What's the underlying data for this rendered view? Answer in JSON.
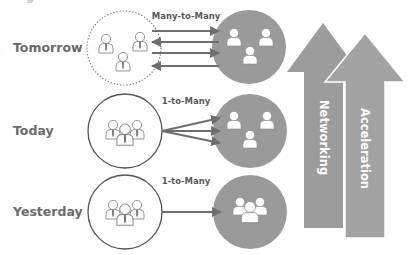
{
  "diagram": {
    "top_fragment": "g",
    "rows": [
      {
        "id": "tomorrow",
        "label": "Tomorrow",
        "link_label": "Many-to-Many",
        "link_type": "many-to-many",
        "source_style": "dotted",
        "arrows": [
          "right",
          "left",
          "right",
          "left"
        ]
      },
      {
        "id": "today",
        "label": "Today",
        "link_label": "1-to-Many",
        "link_type": "fan-out",
        "source_style": "solid",
        "arrows": [
          "right",
          "right",
          "right"
        ]
      },
      {
        "id": "yesterday",
        "label": "Yesterday",
        "link_label": "1-to-Many",
        "link_type": "single",
        "source_style": "solid",
        "arrows": [
          "right"
        ]
      }
    ],
    "trend_arrows": [
      {
        "id": "networking",
        "label": "Networking"
      },
      {
        "id": "acceleration",
        "label": "Acceleration"
      }
    ],
    "icons": {
      "source_group": "people-group-icon",
      "target_group": "people-group-icon",
      "person": "person-icon"
    },
    "colors": {
      "label_text": "#6b6b6b",
      "link_text": "#5a5a5a",
      "arrow_line": "#6e6e6e",
      "filled_circle": "#9a9a9a",
      "trend_arrow": "#9c9c9c",
      "outline": "#555555"
    }
  }
}
